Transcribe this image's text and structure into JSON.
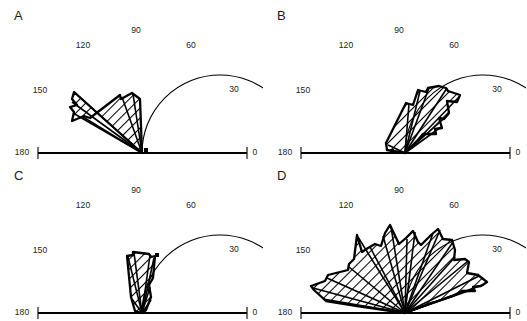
{
  "figure": {
    "panel_count": 4,
    "background_color": "#ffffff",
    "line_color": "#000000",
    "hatch_color": "#000000"
  },
  "axis": {
    "type": "half-polar",
    "angle_min": 0,
    "angle_max": 180,
    "tick_labels": [
      "0",
      "30",
      "60",
      "90",
      "120",
      "150",
      "180"
    ],
    "tick_angles": [
      0,
      30,
      60,
      90,
      120,
      150,
      180
    ],
    "radius_px": 78,
    "units": "degrees"
  },
  "panels": [
    {
      "id": "A",
      "letter": "A",
      "description": "narrow unimodal lobe oriented toward 135 degrees",
      "center": {
        "x": 142,
        "y": 153
      },
      "radius": 78,
      "ticks": [
        {
          "label": "180",
          "x": 22,
          "y": 155
        },
        {
          "label": "150",
          "x": 40,
          "y": 93
        },
        {
          "label": "120",
          "x": 83,
          "y": 48
        },
        {
          "label": "90",
          "x": 136,
          "y": 33
        },
        {
          "label": "60",
          "x": 191,
          "y": 48
        },
        {
          "label": "30",
          "x": 234,
          "y": 92
        },
        {
          "label": "0",
          "x": 255,
          "y": 155
        }
      ],
      "marker": {
        "x": 144,
        "y": 148,
        "size": 4
      },
      "lobe_points": "142,153 74,92 72,99 77,105 70,107 74,112 72,121 84,116 90,118 120,95 121,99 132,93 140,99 142,153",
      "sector_lines": [
        "142,153 74,92",
        "142,153 72,102",
        "142,153 73,113",
        "142,153 83,117",
        "142,153 122,97",
        "142,153 133,94"
      ]
    },
    {
      "id": "B",
      "letter": "B",
      "description": "broad lobe oriented toward 45 to 60 degrees",
      "center": {
        "x": 142,
        "y": 153
      },
      "radius": 78,
      "ticks": [
        {
          "label": "180",
          "x": 22,
          "y": 155
        },
        {
          "label": "150",
          "x": 40,
          "y": 93
        },
        {
          "label": "120",
          "x": 83,
          "y": 48
        },
        {
          "label": "90",
          "x": 136,
          "y": 33
        },
        {
          "label": "60",
          "x": 191,
          "y": 48
        },
        {
          "label": "30",
          "x": 234,
          "y": 92
        },
        {
          "label": "0",
          "x": 255,
          "y": 155
        }
      ],
      "marker": {
        "x": 127,
        "y": 149,
        "size": 4
      },
      "lobe_points": "142,153 124,150 123,143 143,103 150,105 155,90 163,92 165,88 176,86 183,88 185,91 197,95 194,102 184,101 186,113 181,119 176,118 179,128 172,129 173,134 160,134 155,140 142,153",
      "sector_lines": [
        "142,153 125,145",
        "142,153 146,104",
        "142,153 157,91",
        "142,153 166,88",
        "142,153 184,88",
        "142,153 195,98",
        "142,153 185,115",
        "142,153 178,127",
        "142,153 163,133"
      ]
    },
    {
      "id": "C",
      "letter": "C",
      "description": "narrow near-vertical lobe oriented toward 90 degrees",
      "center": {
        "x": 142,
        "y": 153
      },
      "radius": 78,
      "ticks": [
        {
          "label": "180",
          "x": 22,
          "y": 155
        },
        {
          "label": "150",
          "x": 40,
          "y": 93
        },
        {
          "label": "120",
          "x": 83,
          "y": 48
        },
        {
          "label": "90",
          "x": 136,
          "y": 33
        },
        {
          "label": "60",
          "x": 191,
          "y": 48
        },
        {
          "label": "30",
          "x": 234,
          "y": 92
        },
        {
          "label": "0",
          "x": 255,
          "y": 155
        }
      ],
      "marker": {
        "x": 155,
        "y": 93,
        "size": 4
      },
      "lobe_points": "142,153 135,151 131,137 127,96 133,95 133,92 149,94 151,97 155,96 153,118 149,125 151,137 146,150 142,153",
      "sector_lines": [
        "142,153 132,139",
        "142,153 128,97",
        "142,153 134,93",
        "142,153 150,95",
        "142,153 154,98",
        "142,153 150,127",
        "142,153 151,140"
      ]
    },
    {
      "id": "D",
      "letter": "D",
      "description": "broad jagged multimodal distribution spanning the whole half circle",
      "center": {
        "x": 142,
        "y": 153
      },
      "radius": 78,
      "ticks": [
        {
          "label": "180",
          "x": 22,
          "y": 155
        },
        {
          "label": "150",
          "x": 40,
          "y": 93
        },
        {
          "label": "120",
          "x": 83,
          "y": 48
        },
        {
          "label": "90",
          "x": 136,
          "y": 33
        },
        {
          "label": "60",
          "x": 191,
          "y": 48
        },
        {
          "label": "30",
          "x": 234,
          "y": 92
        },
        {
          "label": "0",
          "x": 255,
          "y": 155
        }
      ],
      "marker": null,
      "lobe_points": "142,153 94,146 63,141 51,130 48,126 62,121 65,115 85,110 86,104 91,99 94,75 99,92 105,88 112,84 118,86 122,73 127,65 136,84 143,78 150,71 155,82 158,85 168,75 175,69 180,79 189,80 192,90 191,100 202,99 206,102 204,113 215,115 224,122 218,126 210,127 212,131 199,131 190,136 166,144 142,153",
      "sector_lines": [
        "142,153 60,139",
        "142,153 50,128",
        "142,153 64,118",
        "142,153 86,107",
        "142,153 95,77",
        "142,153 107,87",
        "142,153 120,76",
        "142,153 128,67",
        "142,153 144,79",
        "142,153 152,72",
        "142,153 170,73",
        "142,153 177,70",
        "142,153 190,82",
        "142,153 192,97",
        "142,153 205,101",
        "142,153 216,116",
        "142,153 222,124",
        "142,153 211,129",
        "142,153 193,134",
        "142,153 170,142"
      ]
    }
  ]
}
